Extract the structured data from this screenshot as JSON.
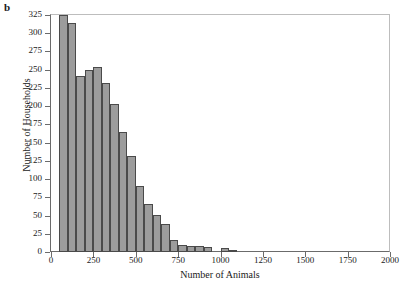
{
  "panel": {
    "label": "b"
  },
  "chart_data": {
    "type": "bar",
    "title": "",
    "subtitle": "",
    "xlabel": "Number of Animals",
    "ylabel": "Number of Households",
    "xlim": [
      0,
      2000
    ],
    "ylim": [
      0,
      325
    ],
    "bin_width": 50,
    "grid": false,
    "legend": null,
    "xticks": [
      0,
      250,
      500,
      750,
      1000,
      1250,
      1500,
      1750,
      2000
    ],
    "xtick_labels": [
      "0",
      "250",
      "500",
      "750",
      "1000",
      "1250",
      "1500",
      "1750",
      "2000"
    ],
    "yticks": [
      0,
      25,
      50,
      75,
      100,
      125,
      150,
      175,
      200,
      225,
      250,
      275,
      300,
      325
    ],
    "ytick_labels": [
      "0",
      "25",
      "50",
      "75",
      "100",
      "125",
      "150",
      "175",
      "200",
      "225",
      "250",
      "275",
      "300",
      "325"
    ],
    "bar_color": "#9c9c9c",
    "bar_edge_color": "#4a4a4a",
    "bins": [
      {
        "x0": 50,
        "x1": 100,
        "value": 325
      },
      {
        "x0": 100,
        "x1": 150,
        "value": 314
      },
      {
        "x0": 150,
        "x1": 200,
        "value": 241
      },
      {
        "x0": 200,
        "x1": 250,
        "value": 250
      },
      {
        "x0": 250,
        "x1": 300,
        "value": 254
      },
      {
        "x0": 300,
        "x1": 350,
        "value": 232
      },
      {
        "x0": 350,
        "x1": 400,
        "value": 203
      },
      {
        "x0": 400,
        "x1": 450,
        "value": 165
      },
      {
        "x0": 450,
        "x1": 500,
        "value": 131
      },
      {
        "x0": 500,
        "x1": 550,
        "value": 91
      },
      {
        "x0": 550,
        "x1": 600,
        "value": 66
      },
      {
        "x0": 600,
        "x1": 650,
        "value": 51
      },
      {
        "x0": 650,
        "x1": 700,
        "value": 39
      },
      {
        "x0": 700,
        "x1": 750,
        "value": 17
      },
      {
        "x0": 750,
        "x1": 800,
        "value": 10
      },
      {
        "x0": 800,
        "x1": 850,
        "value": 8
      },
      {
        "x0": 850,
        "x1": 900,
        "value": 8
      },
      {
        "x0": 900,
        "x1": 950,
        "value": 7
      },
      {
        "x0": 1000,
        "x1": 1050,
        "value": 5
      },
      {
        "x0": 1050,
        "x1": 1100,
        "value": 3
      }
    ]
  }
}
